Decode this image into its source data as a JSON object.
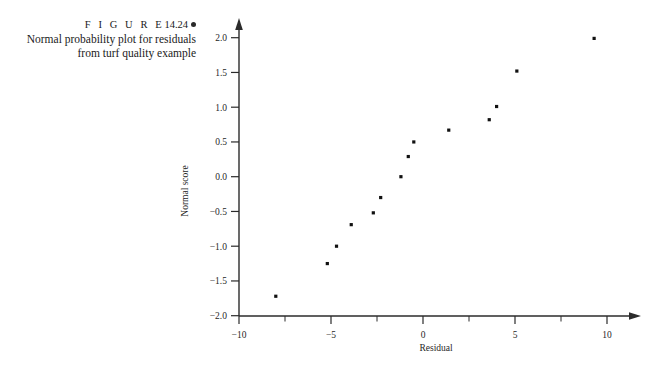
{
  "caption": {
    "figure_word": "F I G U R E",
    "figure_number": "14.24",
    "marker_icon": "filled-circle-bullet",
    "line1": "Normal probability plot for residuals",
    "line2": "from turf quality example"
  },
  "chart_data": {
    "type": "scatter",
    "title": "",
    "xlabel": "Residual",
    "ylabel": "Normal score",
    "xlim": [
      -11.5,
      11.0
    ],
    "ylim": [
      -2.1,
      2.25
    ],
    "grid": false,
    "legend": "none",
    "xticks": [
      -10,
      -5,
      0,
      5,
      10
    ],
    "xticklabels": [
      "-10",
      "-5",
      "0",
      "5",
      "10"
    ],
    "xminorticks": [
      -7.5,
      -2.5,
      2.5,
      7.5
    ],
    "yticks": [
      -2.0,
      -1.5,
      -1.0,
      -0.5,
      0.0,
      0.5,
      1.0,
      1.5,
      2.0
    ],
    "yticklabels": [
      "-2.0",
      "-1.5",
      "-1.0",
      "-0.5",
      "0.0",
      "0.5",
      "1.0",
      "1.5",
      "2.0"
    ],
    "marker": "square",
    "marker_color": "#111111",
    "n_points": 14,
    "points": [
      {
        "x": -8.0,
        "y": -1.72
      },
      {
        "x": -5.2,
        "y": -1.25
      },
      {
        "x": -4.7,
        "y": -1.0
      },
      {
        "x": -3.9,
        "y": -0.69
      },
      {
        "x": -2.7,
        "y": -0.52
      },
      {
        "x": -2.3,
        "y": -0.3
      },
      {
        "x": -1.2,
        "y": 0.0
      },
      {
        "x": -0.8,
        "y": 0.29
      },
      {
        "x": -0.5,
        "y": 0.5
      },
      {
        "x": 1.4,
        "y": 0.67
      },
      {
        "x": 3.6,
        "y": 0.82
      },
      {
        "x": 4.0,
        "y": 1.01
      },
      {
        "x": 5.1,
        "y": 1.52
      },
      {
        "x": 9.3,
        "y": 1.99
      }
    ],
    "series": [
      {
        "name": "residuals",
        "x": [
          -8.0,
          -5.2,
          -4.7,
          -3.9,
          -2.7,
          -2.3,
          -1.2,
          -0.8,
          -0.5,
          1.4,
          3.6,
          4.0,
          5.1,
          9.3
        ],
        "values": [
          -1.72,
          -1.25,
          -1.0,
          -0.69,
          -0.52,
          -0.3,
          0.0,
          0.29,
          0.5,
          0.67,
          0.82,
          1.01,
          1.52,
          1.99
        ]
      }
    ]
  },
  "colors": {
    "axis": "#2b2b2b",
    "marker": "#111111",
    "text": "#1f1f1f",
    "background": "#ffffff"
  }
}
